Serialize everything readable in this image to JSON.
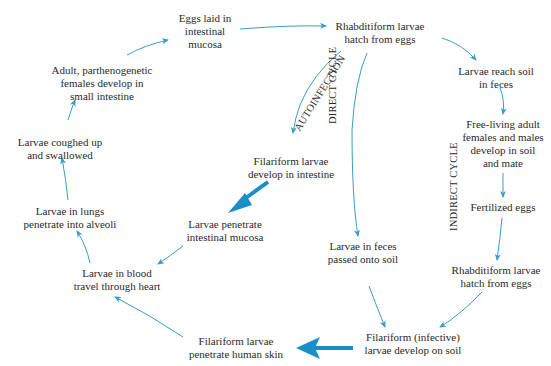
{
  "diagram": {
    "colors": {
      "arrow": "#3a9cc8",
      "arrow_bold": "#1a8fc6",
      "text": "#2a2a2a"
    },
    "nodes": [
      {
        "id": "eggs-laid",
        "lines": [
          "Eggs laid in",
          "intestinal",
          "mucosa"
        ]
      },
      {
        "id": "rhabditiform-hatch-1",
        "lines": [
          "Rhabditiform larvae",
          "hatch from eggs"
        ]
      },
      {
        "id": "larvae-reach-soil",
        "lines": [
          "Larvae reach soil",
          "in feces"
        ]
      },
      {
        "id": "free-living-adults",
        "lines": [
          "Free-living adult",
          "females and males",
          "develop in soil",
          "and mate"
        ]
      },
      {
        "id": "fertilized-eggs",
        "lines": [
          "Fertilized eggs"
        ]
      },
      {
        "id": "rhabditiform-hatch-2",
        "lines": [
          "Rhabditiform larvae",
          "hatch from eggs"
        ]
      },
      {
        "id": "filariform-infective",
        "lines": [
          "Filariform (infective)",
          "larvae develop on soil"
        ]
      },
      {
        "id": "filariform-penetrate-skin",
        "lines": [
          "Filariform larvae",
          "penetrate human skin"
        ]
      },
      {
        "id": "larvae-blood",
        "lines": [
          "Larvae in blood",
          "travel through heart"
        ]
      },
      {
        "id": "larvae-lungs",
        "lines": [
          "Larvae in lungs",
          "penetrate into alveoli"
        ]
      },
      {
        "id": "larvae-coughed",
        "lines": [
          "Larvae coughed up",
          "and swallowed"
        ]
      },
      {
        "id": "adult-females",
        "lines": [
          "Adult, parthenogenetic",
          "females develop in",
          "small intestine"
        ]
      },
      {
        "id": "filariform-intestine",
        "lines": [
          "Filariform larvae",
          "develop in intestine"
        ]
      },
      {
        "id": "larvae-penetrate-mucosa",
        "lines": [
          "Larvae penetrate",
          "intestinal mucosa"
        ]
      },
      {
        "id": "larvae-feces-soil",
        "lines": [
          "Larvae in feces",
          "passed onto soil"
        ]
      }
    ],
    "cycle_labels": {
      "autoinfection": "AUTOINFECTION",
      "direct": "DIRECT CYCLE",
      "indirect": "INDIRECT CYCLE"
    }
  }
}
